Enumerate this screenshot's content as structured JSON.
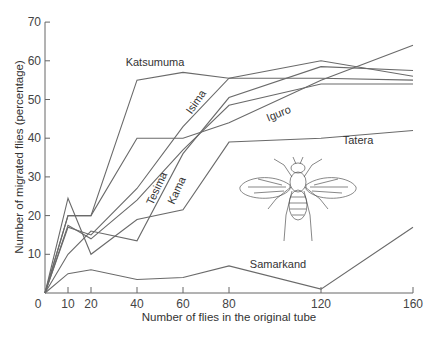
{
  "chart_data": {
    "type": "line",
    "title": "",
    "xlabel": "Number of flies in the original tube",
    "ylabel": "Number of migrated flies (percentage)",
    "x": [
      0,
      10,
      20,
      40,
      60,
      80,
      120,
      160
    ],
    "x_ticks": [
      "0",
      "10",
      "20",
      "40",
      "60",
      "80",
      "120",
      "160"
    ],
    "y_ticks": [
      "10",
      "20",
      "30",
      "40",
      "50",
      "60",
      "70"
    ],
    "xlim": [
      0,
      160
    ],
    "ylim": [
      0,
      70
    ],
    "grid": false,
    "legend": "inline labels",
    "series": [
      {
        "name": "Katsumuma",
        "values": [
          0,
          20,
          20,
          55,
          57,
          55.5,
          55.5,
          55
        ]
      },
      {
        "name": "Isima",
        "values": [
          0,
          17,
          15,
          27,
          43,
          55.5,
          60,
          56
        ]
      },
      {
        "name": "Iguro",
        "values": [
          0,
          17.5,
          14,
          24,
          37,
          48.5,
          54,
          54
        ]
      },
      {
        "name": "Tesima",
        "values": [
          0,
          20,
          20,
          40,
          40,
          44,
          55,
          64
        ]
      },
      {
        "name": "Kama",
        "values": [
          0,
          10,
          16,
          13.5,
          36,
          50.5,
          58.5,
          57.5
        ]
      },
      {
        "name": "Tatera",
        "values": [
          0,
          24.5,
          10,
          19,
          21.5,
          39,
          40,
          42
        ]
      },
      {
        "name": "Samarkand",
        "values": [
          0,
          5,
          6,
          3.5,
          4,
          7,
          1,
          17
        ]
      }
    ],
    "annotations": [
      {
        "text": "Katsumuma",
        "x": 155,
        "y": 66
      },
      {
        "text": "Isima",
        "x": 199,
        "y": 104,
        "rotate": -55
      },
      {
        "text": "Iguro",
        "x": 280,
        "y": 117,
        "rotate": -22
      },
      {
        "text": "Tatera",
        "x": 358,
        "y": 144
      },
      {
        "text": "Tesima",
        "x": 160,
        "y": 190,
        "rotate": -65
      },
      {
        "text": "Kama",
        "x": 180,
        "y": 192,
        "rotate": -65
      },
      {
        "text": "Samarkand",
        "x": 278,
        "y": 268
      }
    ],
    "illustration": "fruit fly drawing (top view)"
  }
}
